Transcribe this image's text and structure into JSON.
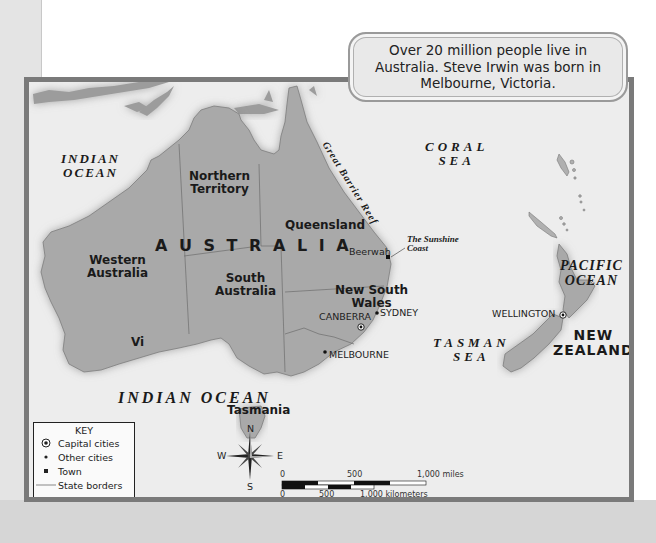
{
  "callout": {
    "text": "Over 20 million people live in Australia. Steve Irwin was born in Melbourne, Victoria."
  },
  "map": {
    "country_label": "A U S T R A L I A",
    "water_bodies": {
      "indian_ocean_nw_line1": "INDIAN",
      "indian_ocean_nw_line2": "OCEAN",
      "coral_sea_line1": "CORAL",
      "coral_sea_line2": "SEA",
      "pacific_ocean_line1": "PACIFIC",
      "pacific_ocean_line2": "OCEAN",
      "tasman_sea_line1": "TASMAN",
      "tasman_sea_line2": "SEA",
      "indian_ocean_south": "INDIAN OCEAN",
      "great_barrier_reef": "Great Barrier Reef"
    },
    "regions": {
      "western_australia": [
        "Western",
        "Australia"
      ],
      "northern_territory": [
        "Northern",
        "Territory"
      ],
      "queensland": "Queensland",
      "south_australia": [
        "South",
        "Australia"
      ],
      "new_south_wales": [
        "New South",
        "Wales"
      ],
      "victoria": "Vi",
      "tasmania": "Tasmania",
      "new_zealand": [
        "NEW",
        "ZEALAND"
      ]
    },
    "places": {
      "beerwah": "Beerwah",
      "sunshine_coast_line1": "The Sunshine",
      "sunshine_coast_line2": "Coast",
      "sydney": "SYDNEY",
      "canberra": "CANBERRA",
      "melbourne": "MELBOURNE",
      "wellington": "WELLINGTON"
    }
  },
  "key": {
    "title": "KEY",
    "items": [
      {
        "symbol": "capital-star-circle",
        "label": "Capital cities"
      },
      {
        "symbol": "dot",
        "label": "Other cities"
      },
      {
        "symbol": "square",
        "label": "Town"
      },
      {
        "symbol": "line",
        "label": "State borders"
      }
    ]
  },
  "compass": {
    "n": "N",
    "s": "S",
    "e": "E",
    "w": "W"
  },
  "scale": {
    "miles_labels": [
      "0",
      "500",
      "1,000 miles"
    ],
    "km_labels": [
      "0",
      "500",
      "1,000 kilometers"
    ]
  },
  "colors": {
    "land": "#a9a9a9",
    "water": "#ededed",
    "frame": "#7a7a7a"
  }
}
